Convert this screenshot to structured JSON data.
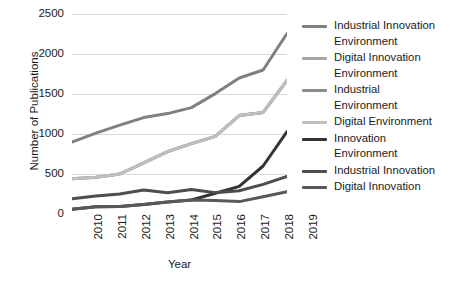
{
  "chart_data": {
    "type": "line",
    "title": "",
    "xlabel": "Year",
    "ylabel": "Number of Publications",
    "categories": [
      "2010",
      "2011",
      "2012",
      "2013",
      "2014",
      "2015",
      "2016",
      "2017",
      "2018",
      "2019"
    ],
    "x": [
      2010,
      2011,
      2012,
      2013,
      2014,
      2015,
      2016,
      2017,
      2018,
      2019
    ],
    "xlim": [
      2010,
      2019
    ],
    "ylim": [
      0,
      2500
    ],
    "yticks": [
      0,
      500,
      1000,
      1500,
      2000,
      2500
    ],
    "grid": true,
    "legend_position": "right",
    "series": [
      {
        "name": "Industrial Innovation Environment",
        "color": "#808080",
        "values": [
          900,
          1010,
          1110,
          1205,
          1255,
          1330,
          1505,
          1700,
          1800,
          2255
        ]
      },
      {
        "name": "Digital Innovation Environment",
        "color": "#a6a6a6",
        "values": [
          440,
          460,
          500,
          640,
          780,
          880,
          970,
          1230,
          1270,
          1670
        ]
      },
      {
        "name": "Industrial Environment",
        "color": "#8c8c8c",
        "values": [
          440,
          460,
          500,
          640,
          780,
          880,
          970,
          1230,
          1270,
          1670
        ]
      },
      {
        "name": "Digital Environment",
        "color": "#bfbfbf",
        "values": [
          440,
          460,
          500,
          640,
          780,
          880,
          970,
          1230,
          1270,
          1670
        ]
      },
      {
        "name": "Innovation Environment",
        "color": "#333333",
        "values": [
          60,
          90,
          95,
          120,
          150,
          175,
          260,
          345,
          600,
          1030
        ]
      },
      {
        "name": "Industrial Innovation",
        "color": "#4d4d4d",
        "values": [
          190,
          225,
          250,
          300,
          265,
          305,
          265,
          290,
          370,
          470
        ]
      },
      {
        "name": "Digital Innovation",
        "color": "#595959",
        "values": [
          60,
          90,
          95,
          120,
          150,
          175,
          170,
          155,
          215,
          280
        ]
      }
    ]
  },
  "y_axis": {
    "label": "Number of Publications",
    "ticks": [
      "2500",
      "2000",
      "1500",
      "1000",
      "500",
      "0"
    ]
  },
  "x_axis": {
    "label": "Year",
    "ticks": [
      "2010",
      "2011",
      "2012",
      "2013",
      "2014",
      "2015",
      "2016",
      "2017",
      "2018",
      "2019"
    ]
  },
  "legend": {
    "items": [
      {
        "label": "Industrial Innovation\nEnvironment",
        "color": "#808080"
      },
      {
        "label": "Digital Innovation\nEnvironment",
        "color": "#a6a6a6"
      },
      {
        "label": "Industrial\nEnvironment",
        "color": "#8c8c8c"
      },
      {
        "label": "Digital Environment",
        "color": "#bfbfbf"
      },
      {
        "label": "Innovation\nEnvironment",
        "color": "#333333"
      },
      {
        "label": "Industrial Innovation",
        "color": "#4d4d4d"
      },
      {
        "label": "Digital Innovation",
        "color": "#595959"
      }
    ]
  },
  "colors": {
    "grid": "#d9d9d9",
    "text": "#1a1a1a",
    "background": "#ffffff"
  }
}
